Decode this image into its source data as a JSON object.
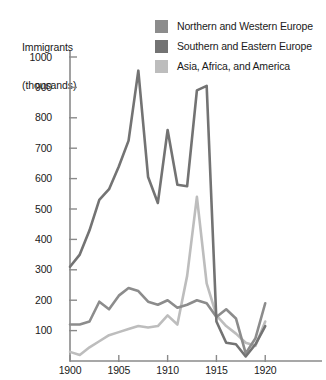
{
  "chart_data": {
    "type": "line",
    "title": "",
    "ylabel": "Immigrants\n(thousands)",
    "ylabel_line1": "Immigrants",
    "ylabel_line2": "(thousands)",
    "xlabel": "",
    "xlim": [
      1900,
      1921
    ],
    "ylim": [
      0,
      1000
    ],
    "ytick_values": [
      100,
      200,
      300,
      400,
      500,
      600,
      700,
      800,
      900,
      1000
    ],
    "ytick_labels": [
      "100",
      "200",
      "300",
      "400",
      "500",
      "600",
      "700",
      "800",
      "900",
      "1000"
    ],
    "xtick_values": [
      1900,
      1905,
      1910,
      1915,
      1920
    ],
    "xtick_labels": [
      "1900",
      "1905",
      "1910",
      "1915",
      "1920"
    ],
    "grid": false,
    "legend_position": "top-right",
    "x": [
      1900,
      1901,
      1902,
      1903,
      1904,
      1905,
      1906,
      1907,
      1908,
      1909,
      1910,
      1911,
      1912,
      1913,
      1914,
      1915,
      1916,
      1917,
      1918,
      1919,
      1920
    ],
    "series": [
      {
        "name": "Northern and Western Europe",
        "color": "#8c8c8c",
        "values": [
          120,
          120,
          130,
          195,
          170,
          215,
          240,
          230,
          195,
          185,
          200,
          175,
          185,
          200,
          190,
          145,
          170,
          140,
          25,
          75,
          190
        ]
      },
      {
        "name": "Southern and Eastern Europe",
        "color": "#737373",
        "values": [
          310,
          350,
          430,
          530,
          565,
          640,
          725,
          955,
          605,
          520,
          760,
          580,
          575,
          890,
          905,
          130,
          60,
          55,
          15,
          55,
          115
        ]
      },
      {
        "name": "Asia, Africa, and America",
        "color": "#bdbdbd",
        "values": [
          30,
          20,
          45,
          65,
          85,
          95,
          105,
          115,
          110,
          115,
          150,
          120,
          280,
          540,
          255,
          150,
          115,
          90,
          60,
          50,
          130
        ]
      }
    ]
  },
  "legend": {
    "items": [
      {
        "label": "Northern and Western Europe",
        "color": "#8c8c8c"
      },
      {
        "label": "Southern and Eastern Europe",
        "color": "#737373"
      },
      {
        "label": "Asia, Africa, and America",
        "color": "#bdbdbd"
      }
    ]
  },
  "axis": {
    "title_line1": "Immigrants",
    "title_line2": "(thousands)"
  },
  "geometry": {
    "plot_left": 70,
    "plot_right": 275,
    "plot_top": 57,
    "plot_bottom": 361,
    "x_min": 1900,
    "x_max": 1921,
    "y_min": 0,
    "y_max": 1000
  }
}
